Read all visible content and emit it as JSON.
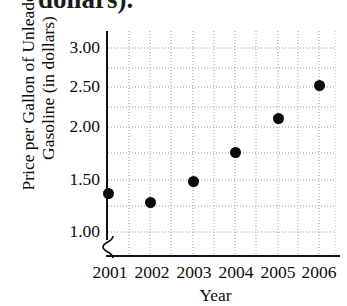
{
  "figure": {
    "clipped_header_text": "dollars).",
    "y_axis_title_lines": [
      "Price per Gallon of Unleaded",
      "Gasoline (in dollars)"
    ],
    "x_axis_title": "Year"
  },
  "chart_data": {
    "type": "scatter",
    "title": "",
    "xlabel": "Year",
    "ylabel": "Price per Gallon of Unleaded Gasoline (in dollars)",
    "categories": [
      "2001",
      "2002",
      "2003",
      "2004",
      "2005",
      "2006"
    ],
    "x": [
      2001,
      2002,
      2003,
      2004,
      2005,
      2006
    ],
    "values": [
      1.42,
      1.35,
      1.56,
      1.88,
      2.24,
      2.58
    ],
    "series": [
      {
        "name": "Price per Gallon of Unleaded Gasoline",
        "values": [
          1.42,
          1.35,
          1.56,
          1.88,
          2.24,
          2.58
        ]
      }
    ],
    "ytick_labels": [
      "1.00",
      "1.50",
      "2.00",
      "2.50",
      "3.00"
    ],
    "ytick_values": [
      1.0,
      1.5,
      2.0,
      2.5,
      3.0
    ],
    "xtick_labels": [
      "2001",
      "2002",
      "2003",
      "2004",
      "2005",
      "2006"
    ],
    "ylim": [
      0.9,
      3.2
    ],
    "xlim": [
      2000.7,
      2006.6
    ],
    "grid": true,
    "grid_style": "dotted",
    "minor_grid": true,
    "legend": "none",
    "axis_break": true,
    "axis_break_location": "y-axis below 1.00",
    "marker": "filled-circle",
    "marker_color": "#0a0a0a"
  },
  "ytick_px": {
    "1.00": 232,
    "1.50": 180,
    "2.00": 127,
    "2.50": 87,
    "3.00": 48
  },
  "point_px": [
    {
      "label": "2001",
      "x": 108,
      "y": 193
    },
    {
      "label": "2002",
      "x": 150,
      "y": 202
    },
    {
      "label": "2003",
      "x": 193,
      "y": 181
    },
    {
      "label": "2004",
      "x": 235,
      "y": 152
    },
    {
      "label": "2005",
      "x": 278,
      "y": 118
    },
    {
      "label": "2006",
      "x": 319,
      "y": 85
    }
  ],
  "xtick_px": [
    {
      "label": "2001",
      "x": 110
    },
    {
      "label": "2002",
      "x": 152
    },
    {
      "label": "2003",
      "x": 194
    },
    {
      "label": "2004",
      "x": 236
    },
    {
      "label": "2005",
      "x": 278
    },
    {
      "label": "2006",
      "x": 319
    }
  ],
  "grid_px": {
    "vertical": [
      129,
      150,
      171,
      193,
      214,
      235,
      256,
      278,
      298,
      319,
      336
    ],
    "horizontal": [
      48,
      68,
      87,
      107,
      127,
      153,
      180,
      206,
      232
    ]
  },
  "colors": {
    "marker": "#0a0a0a",
    "axis": "#121212",
    "grid": "#9a9a9a",
    "text": "#0d0d0d",
    "background": "#ffffff"
  }
}
